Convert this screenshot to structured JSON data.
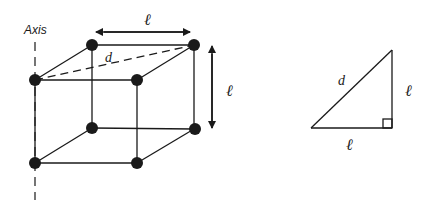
{
  "figure": {
    "axis_label": "Axis",
    "cube": {
      "edge_top_label": "ℓ",
      "edge_side_label": "ℓ",
      "diagonal_label": "d"
    },
    "triangle": {
      "hypotenuse_label": "d",
      "vertical_leg_label": "ℓ",
      "horizontal_leg_label": "ℓ"
    },
    "colors": {
      "stroke": "#1a1a1a",
      "background": "#ffffff"
    }
  }
}
